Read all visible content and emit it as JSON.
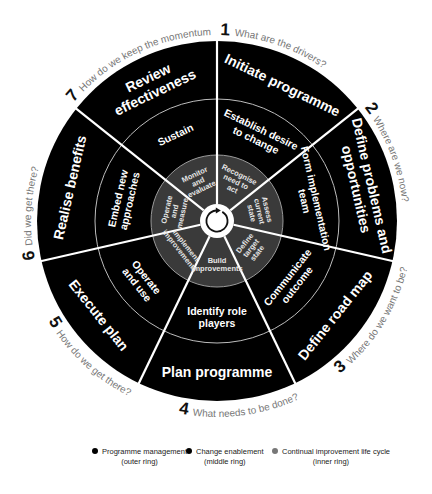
{
  "diagram": {
    "center": {
      "x": 217,
      "y": 221
    },
    "radii": {
      "outer": 180,
      "middle": 122,
      "inner": 66,
      "hub": 17
    },
    "colors": {
      "outer_ring": "#000000",
      "middle_ring": "#000000",
      "inner_ring": "#3a3a3a",
      "divider": "#ffffff",
      "hub": "#ffffff",
      "question_text": "#777777"
    },
    "segments": [
      {
        "number": "1",
        "question": "What are the drivers?",
        "outer": "Initiate programme",
        "middle": [
          "Establish desire",
          "to change"
        ],
        "inner": [
          "Recognise",
          "need to",
          "act"
        ]
      },
      {
        "number": "2",
        "question": "Where are we now?",
        "outer": [
          "Define problems and",
          "opportunities"
        ],
        "middle": [
          "Form implementation",
          "team"
        ],
        "inner": [
          "Assess",
          "current",
          "state"
        ]
      },
      {
        "number": "3",
        "question": "Where do we want to be?",
        "outer": "Define road map",
        "middle": [
          "Communicate",
          "outcome"
        ],
        "inner": [
          "Define",
          "target",
          "state"
        ]
      },
      {
        "number": "4",
        "question": "What needs to be done?",
        "outer": "Plan programme",
        "middle": [
          "Identify role",
          "players"
        ],
        "inner": [
          "Build",
          "improvements"
        ]
      },
      {
        "number": "5",
        "question": "How do we get there?",
        "outer": "Execute plan",
        "middle": [
          "Operate",
          "and use"
        ],
        "inner": [
          "Implement",
          "improvements"
        ]
      },
      {
        "number": "6",
        "question": "Did we get there?",
        "outer": "Realise benefits",
        "middle": [
          "Embed new",
          "approaches"
        ],
        "inner": [
          "Operate",
          "and",
          "measure"
        ]
      },
      {
        "number": "7",
        "question": "How do we keep the momentum going?",
        "outer": [
          "Review",
          "effectiveness"
        ],
        "middle": "Sustain",
        "inner": [
          "Monitor",
          "and",
          "evaluate"
        ]
      }
    ],
    "hub_icon": "circular-arrow-icon"
  },
  "legend": {
    "items": [
      {
        "label": "Programme management",
        "sub": "(outer ring)",
        "color": "#000000"
      },
      {
        "label": "Change enablement",
        "sub": "(middle ring)",
        "color": "#000000"
      },
      {
        "label": "Continual improvement life cycle",
        "sub": "(inner ring)",
        "color": "#777777"
      }
    ]
  }
}
